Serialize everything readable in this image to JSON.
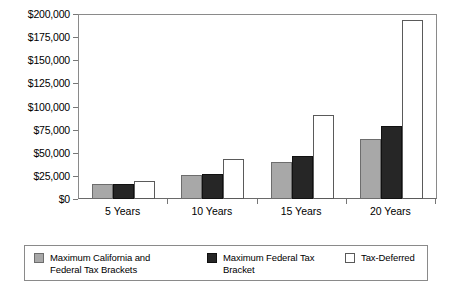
{
  "chart_data": {
    "type": "bar",
    "title": "",
    "subtitle": "",
    "xlabel": "",
    "ylabel": "",
    "categories": [
      "5 Years",
      "10 Years",
      "15 Years",
      "20 Years"
    ],
    "series": [
      {
        "name": "Maximum California and Federal Tax Brackets",
        "color": "#a8a8a8",
        "values": [
          16000,
          26000,
          40000,
          65000
        ]
      },
      {
        "name": "Maximum Federal Tax Bracket",
        "color": "#262626",
        "values": [
          16500,
          27000,
          46000,
          79000
        ]
      },
      {
        "name": "Tax-Deferred",
        "color": "#ffffff",
        "values": [
          20000,
          43000,
          91000,
          194000
        ]
      }
    ],
    "ylim": [
      0,
      200000
    ],
    "ytick_step": 25000,
    "ytick_labels": [
      "$200,000",
      "$175,000",
      "$150,000",
      "$125,000",
      "$100,000",
      "$75,000",
      "$50,000",
      "$25,000",
      "$0"
    ],
    "ytick_values": [
      200000,
      175000,
      150000,
      125000,
      100000,
      75000,
      50000,
      25000,
      0
    ],
    "grid": false,
    "legend_position": "bottom",
    "annotations": []
  },
  "legend": {
    "items": [
      {
        "label_line1": "Maximum California and",
        "label_line2": "Federal Tax Brackets",
        "swatch": "gray-swatch"
      },
      {
        "label_line1": "Maximum Federal Tax",
        "label_line2": "Bracket",
        "swatch": "black-swatch"
      },
      {
        "label_line1": "Tax-Deferred",
        "label_line2": "",
        "swatch": "white-swatch"
      }
    ]
  }
}
